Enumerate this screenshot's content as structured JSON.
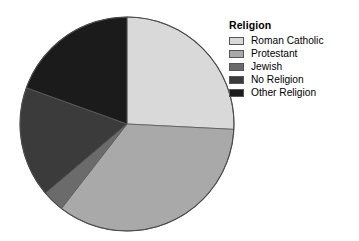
{
  "chart_data": {
    "type": "pie",
    "title": "",
    "legend_title": "Religion",
    "legend_position": "right",
    "categories": [
      "Roman Catholic",
      "Protestant",
      "Jewish",
      "No Religion",
      "Other Religion"
    ],
    "values": [
      25.8,
      34.7,
      3.3,
      16.7,
      19.5
    ],
    "unit": "percent",
    "start_angle_deg": 0,
    "direction": "clockwise",
    "slice_colors": [
      "#d9d9d9",
      "#a9a9a9",
      "#6b6b6b",
      "#3b3b3b",
      "#1b1b1b"
    ],
    "slice_boundaries_deg": [
      0,
      93,
      218,
      230,
      290,
      360
    ],
    "center": {
      "x": 108,
      "y": 108
    },
    "radius": 107,
    "grid": false,
    "xlabel": "",
    "ylabel": ""
  },
  "legend": {
    "title": "Religion",
    "items": [
      {
        "label": "Roman Catholic",
        "color": "#d9d9d9"
      },
      {
        "label": "Protestant",
        "color": "#a9a9a9"
      },
      {
        "label": "Jewish",
        "color": "#6b6b6b"
      },
      {
        "label": "No Religion",
        "color": "#3b3b3b"
      },
      {
        "label": "Other Religion",
        "color": "#1b1b1b"
      }
    ]
  }
}
